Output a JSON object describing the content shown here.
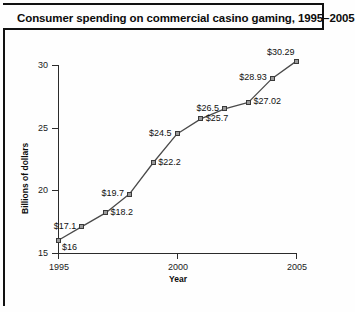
{
  "figure": {
    "title": "Consumer spending on commercial casino gaming, 1995–2005"
  },
  "chart_data": {
    "type": "line",
    "title": "Consumer spending on commercial casino gaming, 1995–2005",
    "xlabel": "Year",
    "ylabel": "Billions of dollars",
    "x": [
      1995,
      1996,
      1997,
      1998,
      1999,
      2000,
      2001,
      2002,
      2003,
      2004,
      2005
    ],
    "values": [
      16,
      17.1,
      18.2,
      19.7,
      22.2,
      24.5,
      25.7,
      26.5,
      27.02,
      28.93,
      30.29
    ],
    "point_labels": [
      "$16",
      "$17.1",
      "$18.2",
      "$19.7",
      "$22.2",
      "$24.5",
      "$25.7",
      "$26.5",
      "$27.02",
      "$28.93",
      "$30.29"
    ],
    "xlim": [
      1995,
      2005
    ],
    "ylim": [
      15,
      30
    ],
    "ytick_labels": [
      "30",
      "25",
      "20",
      "15"
    ],
    "yticks": [
      30,
      25,
      20,
      15
    ],
    "xtick_labels": [
      "1995",
      "2000",
      "2005"
    ],
    "xticks": [
      1995,
      2000,
      2005
    ],
    "grid": false,
    "legend": false,
    "marker": "square",
    "line_color": "#4a4a4a",
    "marker_fill": "#9a9a9a",
    "marker_edge": "#3a3a3a",
    "axis_color": "#2b2b2b",
    "background": "#fefefe"
  }
}
